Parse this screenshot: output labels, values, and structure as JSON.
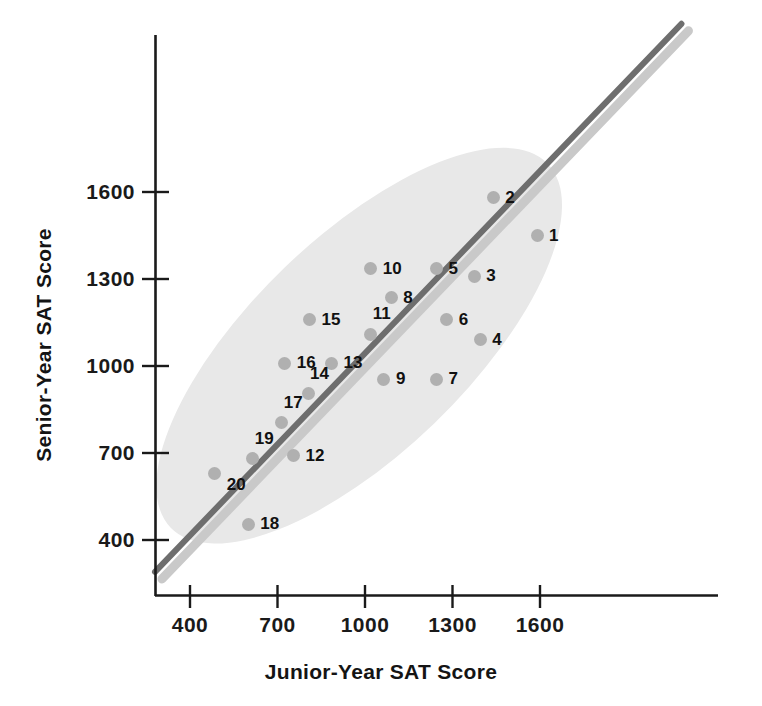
{
  "chart_data": {
    "type": "scatter",
    "title": "",
    "xlabel": "Junior-Year SAT Score",
    "ylabel": "Senior-Year SAT Score",
    "xlim": [
      250,
      2210
    ],
    "ylim": [
      265,
      2335
    ],
    "xticks": [
      400,
      700,
      1000,
      1300,
      1600
    ],
    "yticks": [
      400,
      700,
      1000,
      1300,
      1600
    ],
    "xtick_labels": [
      "400",
      "700",
      "1000",
      "1300",
      "1600"
    ],
    "ytick_labels": [
      "400",
      "700",
      "1000",
      "1300",
      "1600"
    ],
    "grid": false,
    "legend": "none",
    "point_color": "#b0b0b0",
    "reference_line": {
      "label": "y = x identity line",
      "color": "#6e6e6e",
      "shadow_color": "#c9c9c9",
      "from": [
        280,
        290
      ],
      "to": [
        2085,
        2180
      ]
    },
    "ellipse": {
      "label": "data concentration ellipse",
      "fill": "#e8e8e8",
      "center_x": 980,
      "center_y": 1070,
      "rotation_deg": -44
    },
    "points": [
      {
        "label": "1",
        "x": 1590,
        "y": 1450,
        "lx": 12,
        "ly": -9
      },
      {
        "label": "2",
        "x": 1440,
        "y": 1580,
        "lx": 12,
        "ly": -9
      },
      {
        "label": "3",
        "x": 1375,
        "y": 1310,
        "lx": 12,
        "ly": -9
      },
      {
        "label": "4",
        "x": 1395,
        "y": 1090,
        "lx": 12,
        "ly": -9
      },
      {
        "label": "5",
        "x": 1245,
        "y": 1335,
        "lx": 12,
        "ly": -9
      },
      {
        "label": "6",
        "x": 1280,
        "y": 1160,
        "lx": 12,
        "ly": -9
      },
      {
        "label": "7",
        "x": 1245,
        "y": 955,
        "lx": 12,
        "ly": -9
      },
      {
        "label": "8",
        "x": 1090,
        "y": 1235,
        "lx": 12,
        "ly": -9
      },
      {
        "label": "9",
        "x": 1065,
        "y": 955,
        "lx": 12,
        "ly": -9
      },
      {
        "label": "10",
        "x": 1020,
        "y": 1335,
        "lx": 12,
        "ly": -9
      },
      {
        "label": "11",
        "x": 1020,
        "y": 1110,
        "lx": 2,
        "ly": -29
      },
      {
        "label": "12",
        "x": 755,
        "y": 690,
        "lx": 12,
        "ly": -9
      },
      {
        "label": "13",
        "x": 885,
        "y": 1010,
        "lx": 12,
        "ly": -9
      },
      {
        "label": "14",
        "x": 805,
        "y": 905,
        "lx": 2,
        "ly": -29
      },
      {
        "label": "15",
        "x": 810,
        "y": 1160,
        "lx": 12,
        "ly": -9
      },
      {
        "label": "16",
        "x": 725,
        "y": 1010,
        "lx": 12,
        "ly": -9
      },
      {
        "label": "17",
        "x": 715,
        "y": 805,
        "lx": 2,
        "ly": -29
      },
      {
        "label": "18",
        "x": 600,
        "y": 455,
        "lx": 12,
        "ly": -9
      },
      {
        "label": "19",
        "x": 615,
        "y": 680,
        "lx": 2,
        "ly": -29
      },
      {
        "label": "20",
        "x": 485,
        "y": 630,
        "lx": 12,
        "ly": 3
      }
    ]
  }
}
